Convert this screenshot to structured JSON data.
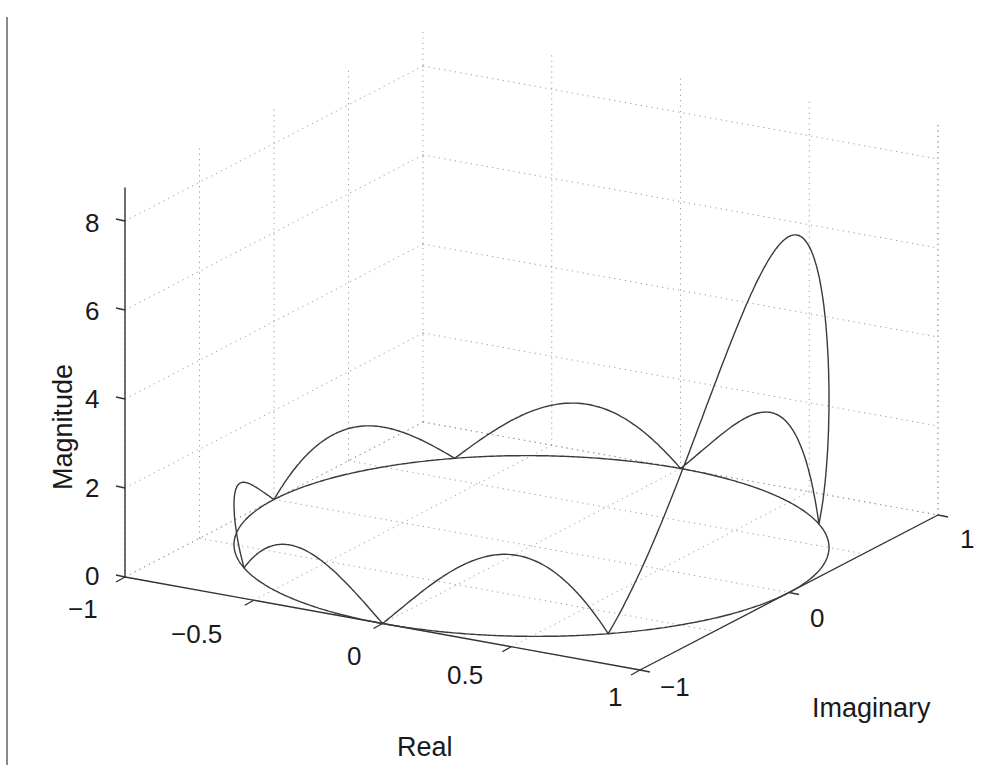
{
  "chart_data": {
    "type": "line3d",
    "title": "",
    "xlabel": "Real",
    "ylabel": "Imaginary",
    "zlabel": "Magnitude",
    "xlim": [
      -1,
      1
    ],
    "ylim": [
      -1,
      1
    ],
    "zlim": [
      0,
      8
    ],
    "xticks": [
      -1,
      -0.5,
      0,
      0.5,
      1
    ],
    "xtick_labels": [
      "−1",
      "−0.5",
      "0",
      "0.5",
      "1"
    ],
    "yticks": [
      -1,
      0,
      1
    ],
    "ytick_labels": [
      "−1",
      "0",
      "1"
    ],
    "zticks": [
      0,
      2,
      4,
      6,
      8
    ],
    "ztick_labels": [
      "0",
      "2",
      "4",
      "6",
      "8"
    ],
    "grid": true,
    "filter_length": 8,
    "peak_magnitude": 8,
    "zeros_at_omega_over_pi": [
      0.25,
      0.5,
      0.75,
      1.0,
      1.25,
      1.5,
      1.75
    ],
    "sidelobe_peaks": [
      1.8,
      1.2,
      1.02
    ],
    "series": [
      {
        "name": "unit circle (z=0)",
        "kind": "circle"
      },
      {
        "name": "|H(e^jw)|",
        "kind": "magnitude"
      }
    ],
    "projection": {
      "origin_px": [
        125,
        577
      ],
      "real_axis_vec_px": [
        515,
        93
      ],
      "imag_axis_vec_px": [
        298,
        -155
      ],
      "z_px_per_unit": 44.5
    },
    "colors": {
      "curve": "#3a3a3a",
      "axis": "#333333",
      "grid": "#9a9a9a",
      "frame_bar": "#8a8a8a"
    }
  }
}
